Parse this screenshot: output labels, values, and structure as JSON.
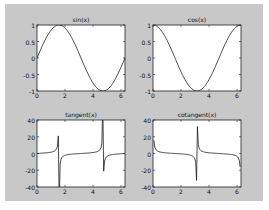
{
  "figure": {
    "background": "#c8c8c8",
    "axes_background": "#ffffff",
    "line_color": "#1a1a1a"
  },
  "chart_data": [
    {
      "type": "line",
      "title": "sin(x)",
      "function": "sin",
      "xlim": [
        0,
        6.2832
      ],
      "ylim": [
        -1,
        1
      ],
      "xticks": [
        0,
        2,
        4,
        6
      ],
      "xtick_labels": [
        "0",
        "2",
        "4",
        "6"
      ],
      "yticks": [
        1,
        0.5,
        0,
        -0.5,
        -1
      ],
      "ytick_labels": [
        "1",
        "0.5",
        "0",
        "-0.5",
        "-1"
      ],
      "grid": false,
      "series": [
        {
          "name": "sin(x)",
          "x_range": [
            0,
            6.2832
          ],
          "samples": 100
        }
      ]
    },
    {
      "type": "line",
      "title": "cos(x)",
      "function": "cos",
      "xlim": [
        0,
        6.2832
      ],
      "ylim": [
        -1,
        1
      ],
      "xticks": [
        0,
        2,
        4,
        6
      ],
      "xtick_labels": [
        "0",
        "2",
        "4",
        "6"
      ],
      "yticks": [
        1,
        0.5,
        0,
        -0.5,
        -1
      ],
      "ytick_labels": [
        "1",
        "0.5",
        "0",
        "-0.5",
        "-1"
      ],
      "grid": false,
      "series": [
        {
          "name": "cos(x)",
          "x_range": [
            0,
            6.2832
          ],
          "samples": 100
        }
      ]
    },
    {
      "type": "line",
      "title": "tangent(x)",
      "function": "tan",
      "xlim": [
        0,
        6.2832
      ],
      "ylim": [
        -40,
        40
      ],
      "xticks": [
        0,
        2,
        4,
        6
      ],
      "xtick_labels": [
        "0",
        "2",
        "4",
        "6"
      ],
      "yticks": [
        40,
        20,
        0,
        -20,
        -40
      ],
      "ytick_labels": [
        "40",
        "20",
        "0",
        "-20",
        "-40"
      ],
      "grid": false,
      "series": [
        {
          "name": "tan(x)",
          "x_range": [
            0,
            6.2832
          ],
          "samples": 100
        }
      ]
    },
    {
      "type": "line",
      "title": "cotangent(x)",
      "function": "cot",
      "xlim": [
        0,
        6.2832
      ],
      "ylim": [
        -40,
        40
      ],
      "xticks": [
        0,
        2,
        4,
        6
      ],
      "xtick_labels": [
        "0",
        "2",
        "4",
        "6"
      ],
      "yticks": [
        40,
        20,
        0,
        -20,
        -40
      ],
      "ytick_labels": [
        "40",
        "20",
        "0",
        "-20",
        "-40"
      ],
      "grid": false,
      "series": [
        {
          "name": "cot(x)",
          "x_range": [
            0.0628,
            6.2204
          ],
          "samples": 100
        }
      ]
    }
  ]
}
